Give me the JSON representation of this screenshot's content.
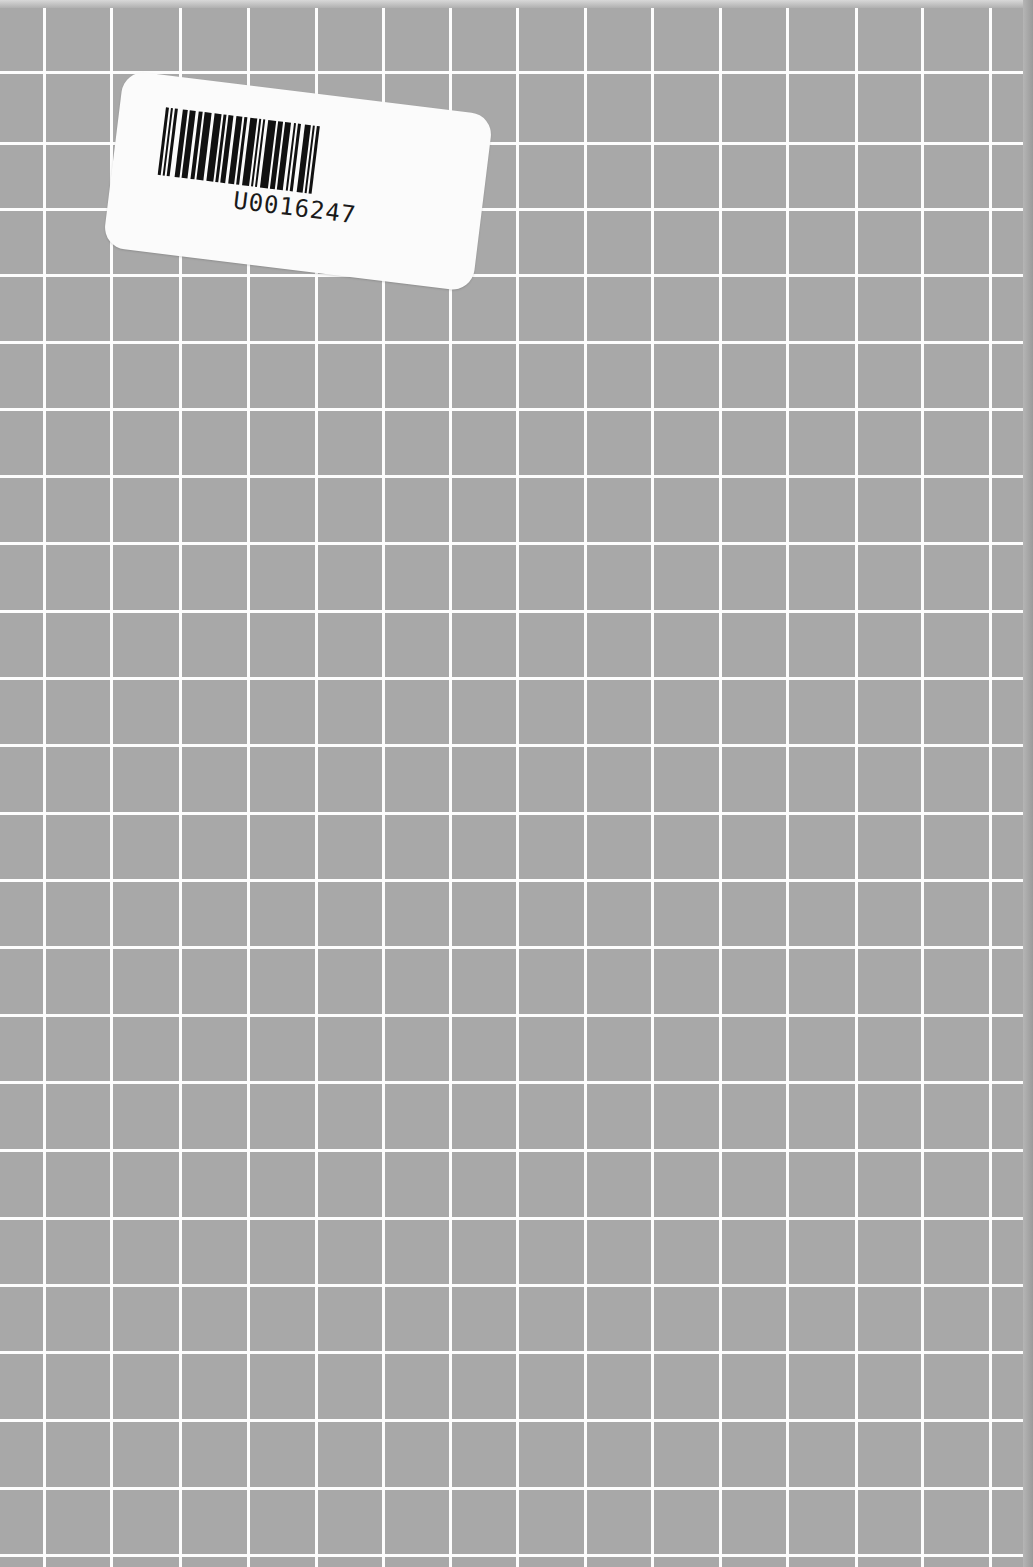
{
  "scene": {
    "description": "Gray notebook cover with white hand-drawn grid and a barcode sticker",
    "background_color": "#a8a8a8",
    "grid_line_color": "#fdfdfd",
    "grid": {
      "vertical_lines_x": [
        44,
        111,
        180,
        248,
        316,
        383,
        450,
        517,
        585,
        652,
        720,
        787,
        856,
        922,
        990
      ],
      "horizontal_lines_y": [
        72,
        143,
        209,
        275,
        342,
        409,
        476,
        543,
        611,
        678,
        745,
        813,
        880,
        947,
        1015,
        1082,
        1150,
        1218,
        1285,
        1352,
        1420,
        1488,
        1555
      ]
    }
  },
  "sticker": {
    "code": "U0016247",
    "icon": "barcode-icon",
    "bars": [
      3,
      2,
      2,
      2,
      3,
      5,
      5,
      2,
      6,
      3,
      4,
      2,
      7,
      3,
      7,
      2,
      3,
      2,
      5,
      3,
      6,
      2,
      3,
      3,
      7,
      2,
      2,
      2,
      2,
      3,
      8,
      2,
      5,
      2,
      6,
      3,
      2,
      2,
      3,
      4,
      6,
      2,
      2,
      2,
      3,
      3
    ]
  }
}
